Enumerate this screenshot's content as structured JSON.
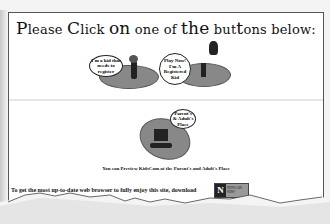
{
  "header": {
    "title_parts": [
      "P",
      "lease ",
      "C",
      "lick ",
      "on",
      " one of ",
      "the",
      " but",
      "t",
      "ons be",
      "low:"
    ]
  },
  "buttons": {
    "new_kid": {
      "bubble_text": "I'm a kid that needs to register"
    },
    "registered_kid": {
      "bubble_text": "Play Now! I'm A Registered Kid"
    },
    "parents": {
      "bubble_text": "Parent's & Adult's Place"
    }
  },
  "caption": "You can Preview KidsCom at the Parent's and Adult's Place",
  "browser_notice": {
    "text": "To get the most up-to-date web browser to fully enjoy this site, download",
    "badge_letter": "N",
    "badge_label": "NETSCAPE NOW!"
  },
  "footer": {
    "counter_text": "Please be the 65372nd person to access this site!"
  },
  "colors": {
    "oval_fill": "#888888",
    "page_bg": "#ffffff",
    "border": "#555555"
  }
}
